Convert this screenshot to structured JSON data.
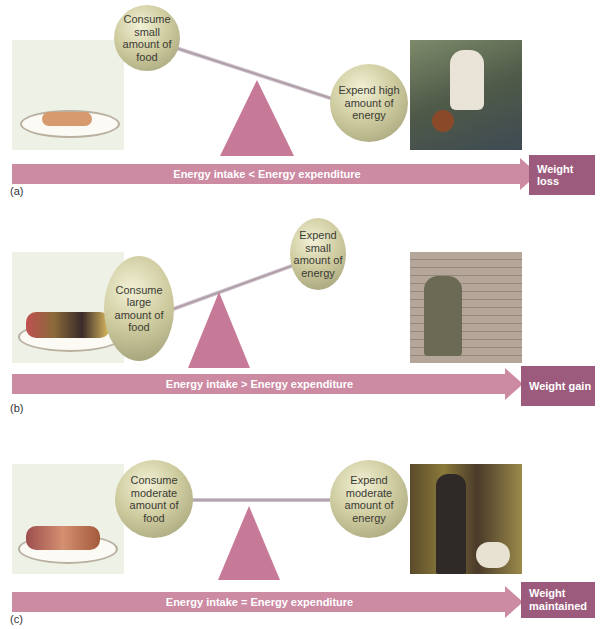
{
  "colors": {
    "arrow": "#cc8aa3",
    "result_box": "#9c5a7c",
    "sphere": "#cfcca0",
    "pyramid": "#c77a97"
  },
  "panels": [
    {
      "id": "a",
      "label": "(a)",
      "left_sphere": "Consume small amount of food",
      "right_sphere": "Expend high amount of energy",
      "arrow_text": "Energy intake < Energy expenditure",
      "result": "Weight loss",
      "photo": "man-dribbling-basketball",
      "food": "small-plate-of-food"
    },
    {
      "id": "b",
      "label": "(b)",
      "left_sphere": "Consume large amount of food",
      "right_sphere": "Expend small amount of energy",
      "arrow_text": "Energy intake > Energy expenditure",
      "result": "Weight gain",
      "photo": "man-sitting-with-laptop",
      "food": "large-plate-of-food"
    },
    {
      "id": "c",
      "label": "(c)",
      "left_sphere": "Consume moderate amount of food",
      "right_sphere": "Expend moderate amount of energy",
      "arrow_text": "Energy intake = Energy expenditure",
      "result": "Weight maintained",
      "photo": "woman-walking-dog",
      "food": "moderate-plate-of-food"
    }
  ]
}
